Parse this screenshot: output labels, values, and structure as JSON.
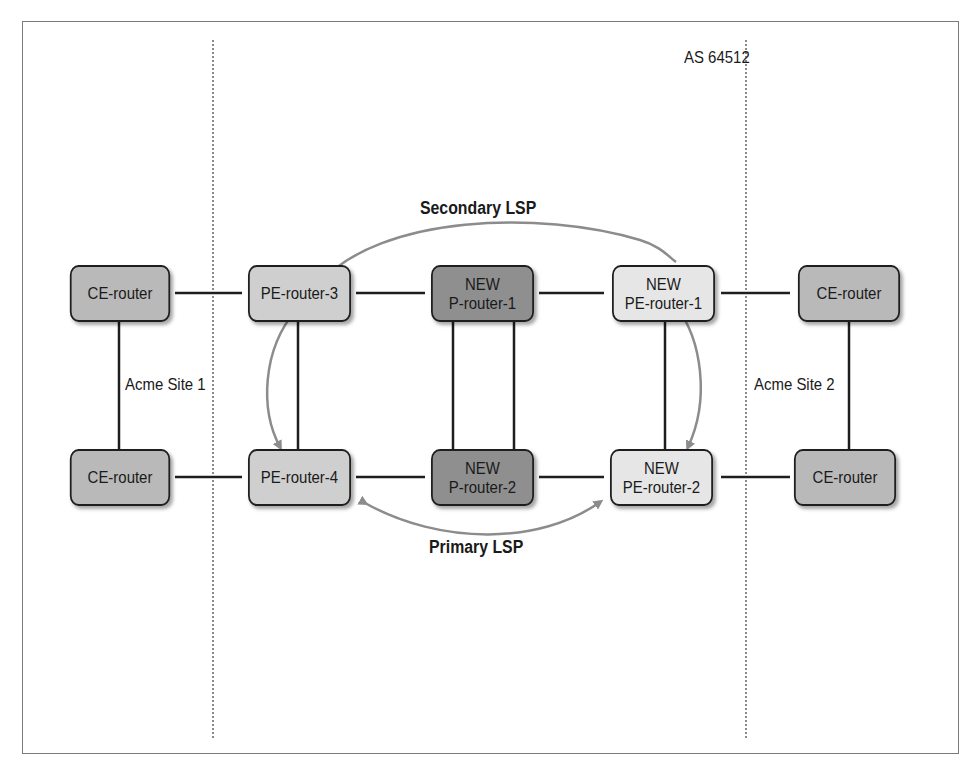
{
  "diagram": {
    "as_label": "AS 64512",
    "site_labels": {
      "site1": "Acme Site 1",
      "site2": "Acme Site 2"
    },
    "lsp_labels": {
      "secondary": "Secondary LSP",
      "primary": "Primary LSP"
    },
    "nodes": {
      "ce_top_left": {
        "line1": "",
        "line2": "CE-router"
      },
      "ce_bottom_left": {
        "line1": "",
        "line2": "CE-router"
      },
      "pe3": {
        "line1": "",
        "line2": "PE-router-3"
      },
      "pe4": {
        "line1": "",
        "line2": "PE-router-4"
      },
      "p1": {
        "line1": "NEW",
        "line2": "P-router-1"
      },
      "p2": {
        "line1": "NEW",
        "line2": "P-router-2"
      },
      "pe1": {
        "line1": "NEW",
        "line2": "PE-router-1"
      },
      "pe2": {
        "line1": "NEW",
        "line2": "PE-router-2"
      },
      "ce_top_right": {
        "line1": "",
        "line2": "CE-router"
      },
      "ce_bottom_right": {
        "line1": "",
        "line2": "CE-router"
      }
    },
    "colors": {
      "ce_fill": "#b9b9b9",
      "pe_fill": "#cfcfcf",
      "p_fill": "#8f8f8f",
      "new_pe_fill": "#e6e6e6",
      "link": "#1e1e1e",
      "lsp_arrow": "#8c8c8c"
    }
  }
}
